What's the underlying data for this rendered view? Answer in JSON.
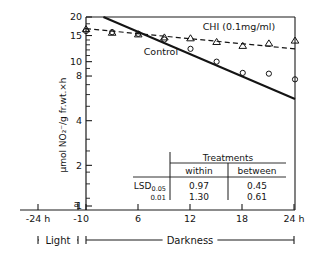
{
  "chart_data": {
    "type": "line",
    "title": "",
    "xlabel": "",
    "ylabel": "μmol NO₂⁻/g fr.wt.×h",
    "y_scale": "log",
    "ylim": [
      1,
      21
    ],
    "xlim": [
      -26,
      25.5
    ],
    "grid": false,
    "legend_position": "inline-annotations",
    "y_ticks": [
      {
        "value": 20,
        "label": "20"
      },
      {
        "value": 15,
        "label": "15"
      },
      {
        "value": 10,
        "label": "10"
      },
      {
        "value": 8,
        "label": "8"
      },
      {
        "value": 4,
        "label": "4"
      },
      {
        "value": 2,
        "label": "2"
      },
      {
        "value": 1,
        "label": "1"
      }
    ],
    "y_minor_ticks": [
      18,
      16,
      14,
      13,
      12,
      11,
      9,
      7,
      6,
      5,
      3,
      2.5,
      1.8,
      1.5,
      1.2
    ],
    "x_ticks": [
      {
        "value": -24,
        "label": "-24 h"
      },
      {
        "value": -1,
        "label": "-1"
      },
      {
        "value": 0,
        "label": "0"
      },
      {
        "value": 6,
        "label": "6"
      },
      {
        "value": 12,
        "label": "12"
      },
      {
        "value": 18,
        "label": "18"
      },
      {
        "value": 24,
        "label": "24 h"
      }
    ],
    "origin_marker_label": "a",
    "series": [
      {
        "name": "Control",
        "marker": "circle",
        "line_style": "solid",
        "annotation": "Control",
        "annotation_x": 8.6,
        "annotation_y": 11.1,
        "fit_line": {
          "x0": 2.0,
          "y0": 20.0,
          "x1": 24.0,
          "y1": 5.6
        },
        "x": [
          0,
          3,
          6,
          9,
          12,
          15,
          18,
          21,
          24
        ],
        "y": [
          16.1,
          15.8,
          15.4,
          14.1,
          12.2,
          10.0,
          8.4,
          8.3,
          7.6
        ]
      },
      {
        "name": "CHI (0.1mg/ml)",
        "marker": "triangle",
        "line_style": "dashed",
        "annotation": "CHI (0.1mg/ml)",
        "annotation_x": 13.4,
        "annotation_y": 16.3,
        "fit_line": {
          "x0": 0.0,
          "y0": 16.7,
          "x1": 24.0,
          "y1": 12.2
        },
        "x": [
          0,
          3,
          6,
          9,
          12,
          15,
          18,
          21,
          24
        ],
        "y": [
          16.6,
          15.7,
          15.3,
          14.6,
          14.4,
          13.6,
          12.8,
          13.3,
          13.9
        ]
      }
    ],
    "phase_bars": [
      {
        "label": "Light",
        "from": -24,
        "to": -1
      },
      {
        "label": "Darkness",
        "from": 0,
        "to": 24
      }
    ],
    "inset_table": {
      "header_span": "Treatments",
      "columns": [
        "within",
        "between"
      ],
      "rows": [
        {
          "label": "LSD",
          "sub": "0.05",
          "within": "0.97",
          "between": "0.45"
        },
        {
          "label": "",
          "sub": "0.01",
          "within": "1.30",
          "between": "0.61"
        }
      ]
    }
  },
  "colors": {
    "ink": "#141414",
    "axis": "#1a1a1a",
    "background": "#ffffff"
  }
}
